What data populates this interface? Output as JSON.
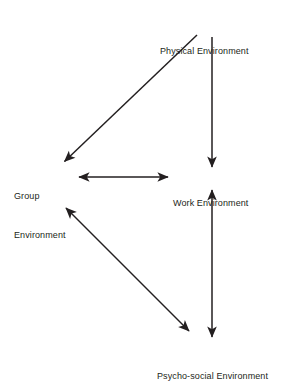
{
  "diagram": {
    "type": "influence-diagram",
    "background_color": "#ffffff",
    "line_color": "#231f20",
    "text_color": "#231f20",
    "nodes": [
      {
        "id": "physical",
        "label": "Physical Environment",
        "lines": [
          "Physical Environment"
        ]
      },
      {
        "id": "group",
        "label": "Group Environment",
        "lines": [
          "Group",
          "Environment"
        ]
      },
      {
        "id": "work",
        "label": "Work Environment",
        "lines": [
          "Work Environment"
        ]
      },
      {
        "id": "psycho",
        "label": "Psycho-social Environment",
        "lines": [
          "Psycho-social Environment"
        ]
      }
    ],
    "edges": [
      {
        "id": "physical-to-group",
        "from": "physical",
        "to": "group",
        "direction": "single",
        "style": "diagonal"
      },
      {
        "id": "physical-to-work",
        "from": "physical",
        "to": "work",
        "direction": "single",
        "style": "vertical"
      },
      {
        "id": "group-work",
        "from": "group",
        "to": "work",
        "direction": "double",
        "style": "horizontal"
      },
      {
        "id": "group-psycho",
        "from": "group",
        "to": "psycho",
        "direction": "double",
        "style": "diagonal"
      },
      {
        "id": "work-psycho",
        "from": "work",
        "to": "psycho",
        "direction": "double",
        "style": "vertical"
      }
    ]
  }
}
